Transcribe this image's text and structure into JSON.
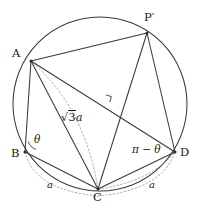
{
  "figure": {
    "stroke_color": "#3a3a3a",
    "dash_color": "#9a9a9a",
    "label_color": "#1a1a1a",
    "background": "#ffffff"
  },
  "circle": {
    "cx": 100,
    "cy": 104,
    "r": 87
  },
  "points": [
    {
      "id": "A",
      "label": "A",
      "x": 31,
      "y": 61,
      "label_x": 12,
      "label_y": 48
    },
    {
      "id": "P'",
      "label": "P′",
      "x": 147,
      "y": 33,
      "label_x": 144,
      "label_y": 12
    },
    {
      "id": "B",
      "label": "B",
      "x": 25,
      "y": 152,
      "label_x": 11,
      "label_y": 148
    },
    {
      "id": "C",
      "label": "C",
      "x": 98,
      "y": 189,
      "label_x": 93,
      "label_y": 192
    },
    {
      "id": "D",
      "label": "D",
      "x": 175,
      "y": 152,
      "label_x": 180,
      "label_y": 147
    }
  ],
  "segments": [
    {
      "name": "A-Pprime",
      "from": "A",
      "to": "P'",
      "style": "solid"
    },
    {
      "name": "A-B",
      "from": "A",
      "to": "B",
      "style": "solid"
    },
    {
      "name": "A-C",
      "from": "A",
      "to": "C",
      "style": "solid"
    },
    {
      "name": "A-D",
      "from": "A",
      "to": "D",
      "style": "solid"
    },
    {
      "name": "B-C",
      "from": "B",
      "to": "C",
      "style": "solid"
    },
    {
      "name": "C-D",
      "from": "C",
      "to": "D",
      "style": "solid"
    },
    {
      "name": "Pprime-C",
      "from": "P'",
      "to": "C",
      "style": "solid"
    },
    {
      "name": "Pprime-D",
      "from": "P'",
      "to": "D",
      "style": "solid"
    }
  ],
  "dashed": {
    "arc_A_to_C": "dotted arc from A bulging right down to C",
    "arc_B_to_C_label_a": "dotted arc under B-C carrying length label a",
    "arc_C_to_D_label_a": "dotted arc under C-D carrying length label a",
    "arc_C_to_D_inner": "dotted arc from C up to D"
  },
  "annotations": {
    "theta": {
      "text": "θ",
      "x": 34,
      "y": 134,
      "meaning": "angle ABC at vertex B"
    },
    "pi_minus_theta": {
      "text": "π − θ",
      "x": 132,
      "y": 144,
      "meaning": "angle ADC at vertex D, supplementary to theta"
    },
    "sqrt3a": {
      "radical": "√",
      "radicand": "3",
      "variable": "a",
      "full_text": "√3a",
      "x": 61,
      "y": 112,
      "meaning": "length of chord AC"
    },
    "side_a_left": {
      "text": "a",
      "x": 47,
      "y": 180,
      "meaning": "length of side BC"
    },
    "side_a_right": {
      "text": "a",
      "x": 149,
      "y": 180,
      "meaning": "length of side CD"
    },
    "right_angle": {
      "x": 110,
      "y": 99,
      "size": 7,
      "meaning": "perpendicular foot from P-prime onto AD"
    }
  }
}
